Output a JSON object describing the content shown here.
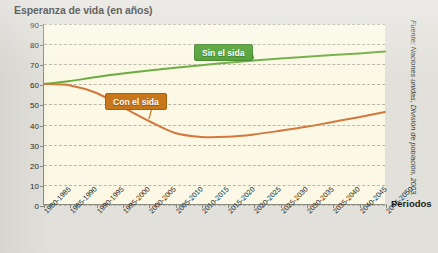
{
  "title": "Esperanza de vida (en años)",
  "x_axis_title": "Periodos",
  "source": "Fuente: Naciones unidas, División de población, 2003.",
  "legend": {
    "green_label": "Sin el sida",
    "orange_label": "Con el sida"
  },
  "colors": {
    "background": "#e2e0da",
    "plot_background": "#fbf8e6",
    "axis": "#8a8a80",
    "grid": "#b9b6a4",
    "green": "#6aab3c",
    "orange": "#d2783c",
    "green_box": "#4a9d2d",
    "orange_box": "#c8761a"
  },
  "chart_data": {
    "type": "line",
    "title": "Esperanza de vida (en años)",
    "xlabel": "Periodos",
    "ylabel": "",
    "ylim": [
      0,
      90
    ],
    "ytick_step": 10,
    "grid": true,
    "legend_position": "inline-callouts",
    "yticks": [
      0,
      10,
      20,
      30,
      40,
      50,
      60,
      70,
      80,
      90
    ],
    "categories": [
      "1980-1985",
      "1985-1990",
      "1990-1995",
      "1995-2000",
      "2000-2005",
      "2005-2010",
      "2010-2015",
      "2015-2020",
      "2020-2025",
      "2025-2030",
      "2030-2035",
      "2035-2040",
      "2040-2045",
      "2045-2050"
    ],
    "series": [
      {
        "name": "Sin el sida",
        "color": "#6aab3c",
        "values": [
          60,
          61.5,
          63.5,
          65.2,
          66.7,
          68.1,
          69.4,
          70.6,
          71.7,
          72.7,
          73.6,
          74.5,
          75.3,
          76.2
        ]
      },
      {
        "name": "Con el sida",
        "color": "#d2783c",
        "values": [
          60,
          59.3,
          55.5,
          48.5,
          41.5,
          35.5,
          33.5,
          33.6,
          34.8,
          36.6,
          38.6,
          41.0,
          43.4,
          46.0
        ]
      }
    ]
  }
}
